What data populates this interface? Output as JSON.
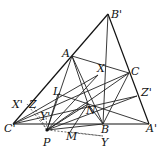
{
  "diagram": {
    "type": "geometry-figure",
    "points": {
      "B'": [
        108,
        14
      ],
      "A": [
        72,
        56
      ],
      "C": [
        129,
        73
      ],
      "X": [
        98,
        75
      ],
      "L": [
        58,
        94
      ],
      "N": [
        88,
        104
      ],
      "Z'": [
        137,
        96
      ],
      "X'": [
        27,
        104
      ],
      "Z": [
        33,
        106
      ],
      "Y'": [
        46,
        116
      ],
      "C'": [
        13,
        124
      ],
      "B": [
        103,
        124
      ],
      "A'": [
        149,
        124
      ],
      "P": [
        47,
        130
      ],
      "M": [
        70,
        132
      ],
      "Y": [
        103,
        136
      ]
    },
    "labels": [
      {
        "text": "B'",
        "x": 111,
        "y": 18
      },
      {
        "text": "A",
        "x": 62,
        "y": 57
      },
      {
        "text": "C",
        "x": 131,
        "y": 75
      },
      {
        "text": "X",
        "x": 97,
        "y": 72
      },
      {
        "text": "L",
        "x": 53,
        "y": 95
      },
      {
        "text": "Z'",
        "x": 141,
        "y": 96
      },
      {
        "text": "X'",
        "x": 12,
        "y": 108
      },
      {
        "text": "Z",
        "x": 29,
        "y": 108
      },
      {
        "text": "N",
        "x": 86,
        "y": 114
      },
      {
        "text": "Y'",
        "x": 40,
        "y": 120
      },
      {
        "text": "C'",
        "x": 4,
        "y": 132
      },
      {
        "text": "B",
        "x": 101,
        "y": 133
      },
      {
        "text": "A'",
        "x": 146,
        "y": 132
      },
      {
        "text": "P",
        "x": 43,
        "y": 146
      },
      {
        "text": "M",
        "x": 66,
        "y": 140
      },
      {
        "text": "Y",
        "x": 101,
        "y": 146
      }
    ],
    "segments_solid": [
      [
        "C'",
        "B'"
      ],
      [
        "B'",
        "A'"
      ],
      [
        "C'",
        "A'"
      ],
      [
        "B'",
        "B"
      ],
      [
        "A",
        "C"
      ],
      [
        "A",
        "P"
      ],
      [
        "A",
        "N"
      ],
      [
        "A",
        "B"
      ],
      [
        "C",
        "P"
      ],
      [
        "C",
        "B"
      ],
      [
        "C",
        "C'"
      ],
      [
        "X",
        "C'"
      ],
      [
        "X",
        "P"
      ],
      [
        "L",
        "A'"
      ],
      [
        "L",
        "P"
      ],
      [
        "Z'",
        "C'"
      ],
      [
        "Z'",
        "P"
      ],
      [
        "N",
        "P"
      ],
      [
        "N",
        "B"
      ],
      [
        "N",
        "M"
      ],
      [
        "P",
        "B"
      ]
    ],
    "segments_dashed": [
      [
        "P",
        "Y"
      ],
      [
        "M",
        "Y"
      ],
      [
        "P",
        "Y'"
      ],
      [
        "P",
        "X'"
      ],
      [
        "P",
        "Z"
      ],
      [
        "P",
        "N"
      ]
    ]
  }
}
